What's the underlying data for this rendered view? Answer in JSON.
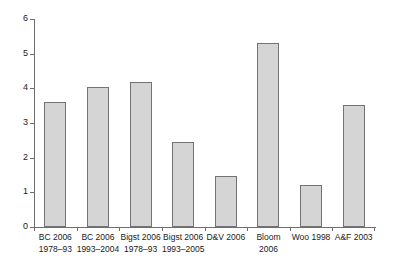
{
  "chart_data": {
    "type": "bar",
    "title": "",
    "subtitle": "",
    "xlabel": "",
    "ylabel": "",
    "ylim": [
      0,
      6
    ],
    "yticks": [
      0,
      1,
      2,
      3,
      4,
      5,
      6
    ],
    "ytick_labels": [
      "0",
      "1",
      "2",
      "3",
      "4",
      "5",
      "6"
    ],
    "grid": false,
    "legend": false,
    "bar_fill_color": "#d5d5d5",
    "bar_edge_color": "#737373",
    "axis_color": "#6e6e6e",
    "categories": [
      "BC 2006 1978–93",
      "BC 2006 1993–2004",
      "Bigst 2006 1978–93",
      "Bigst 2006 1993–2005",
      "D&V 2006",
      "Bloom 2006",
      "Woo 1998",
      "A&F 2003"
    ],
    "category_lines": [
      [
        "BC 2006",
        "1978–93"
      ],
      [
        "BC 2006",
        "1993–2004"
      ],
      [
        "Bigst 2006",
        "1978–93"
      ],
      [
        "Bigst 2006",
        "1993–2005"
      ],
      [
        "D&V 2006",
        ""
      ],
      [
        "Bloom",
        "2006"
      ],
      [
        "Woo 1998",
        ""
      ],
      [
        "A&F 2003",
        ""
      ]
    ],
    "values": [
      3.6,
      4.05,
      4.18,
      2.45,
      1.47,
      5.3,
      1.2,
      3.52
    ]
  }
}
